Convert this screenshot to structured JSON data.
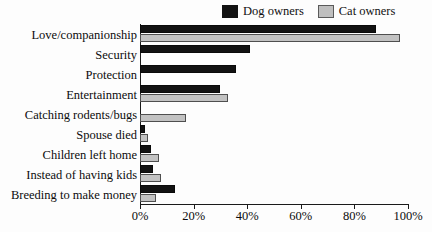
{
  "chart_data": {
    "type": "bar",
    "orientation": "horizontal",
    "title": "",
    "xlabel": "",
    "ylabel": "",
    "xlim": [
      0,
      100
    ],
    "x_unit": "%",
    "grid": false,
    "legend_position": "top-right",
    "categories": [
      "Love/companionship",
      "Security",
      "Protection",
      "Entertainment",
      "Catching rodents/bugs",
      "Spouse died",
      "Children left home",
      "Instead of having kids",
      "Breeding to make money"
    ],
    "series": [
      {
        "name": "Dog owners",
        "color": "#121212",
        "values": [
          88,
          41,
          36,
          30,
          0,
          2,
          4,
          5,
          13
        ]
      },
      {
        "name": "Cat owners",
        "color": "#c2c2c2",
        "values": [
          97,
          0,
          0,
          33,
          17,
          3,
          7,
          8,
          6
        ]
      }
    ],
    "xticks": [
      0,
      20,
      40,
      60,
      80,
      100
    ],
    "xtick_labels": [
      "0%",
      "20%",
      "40%",
      "60%",
      "80%",
      "100%"
    ]
  },
  "legend": {
    "entries": [
      {
        "label": "Dog owners",
        "swatch": "dog"
      },
      {
        "label": "Cat owners",
        "swatch": "cat"
      }
    ]
  }
}
